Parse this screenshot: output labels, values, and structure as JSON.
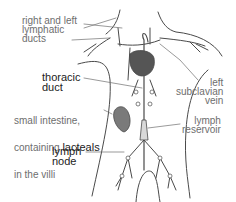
{
  "colors": {
    "outline": "#4a4a4a",
    "label_regular": "#6e6e6e",
    "label_bold": "#222222",
    "organ_fill": "#555555",
    "vessel_fill": "#d9d9d9",
    "background": "#ffffff"
  },
  "labels": {
    "lymphatic_ducts": "right and left\nlymphatic\nducts",
    "thoracic_duct": "thoracic\nduct",
    "small_intestine_line1": "small intestine,",
    "small_intestine_line2_prefix": "containing ",
    "small_intestine_line2_bold": "lacteals",
    "small_intestine_line3": "in the villi",
    "lymph_node": "lymph\nnode",
    "left_subclavian_vein": "left\nsubclavian\nvein",
    "lymph_reservoir": "lymph\nreservoir"
  }
}
